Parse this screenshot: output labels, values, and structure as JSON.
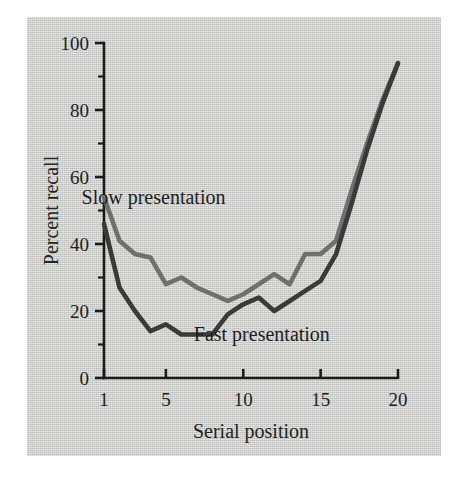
{
  "figure": {
    "background_color": "#ffffff",
    "panel_color": "#cccccb"
  },
  "chart_data": {
    "type": "line",
    "title": "",
    "subtitle": "",
    "xlabel": "Serial position",
    "ylabel": "Percent recall",
    "xlim": [
      1,
      20
    ],
    "ylim": [
      0,
      100
    ],
    "grid": false,
    "legend_position": "inline-annotation",
    "x_ticks_major": [
      1,
      5,
      10,
      15,
      20
    ],
    "x_tick_labels": [
      "1",
      "5",
      "10",
      "15",
      "20"
    ],
    "y_ticks_major": [
      0,
      20,
      40,
      60,
      80,
      100
    ],
    "y_tick_labels": [
      "0",
      "20",
      "40",
      "60",
      "80",
      "100"
    ],
    "y_ticks_minor": [
      10,
      30,
      50,
      70,
      90
    ],
    "x": [
      1,
      2,
      3,
      4,
      5,
      6,
      7,
      8,
      9,
      10,
      11,
      12,
      13,
      14,
      15,
      16,
      17,
      18,
      19,
      20
    ],
    "series": [
      {
        "name": "Slow presentation",
        "color": "#6f6f6f",
        "stroke_width": 4.6,
        "label_x": 4.2,
        "label_y": 52,
        "values": [
          54,
          41,
          37,
          36,
          28,
          30,
          27,
          25,
          23,
          25,
          28,
          31,
          28,
          37,
          37,
          41,
          56,
          70,
          83,
          94
        ]
      },
      {
        "name": "Fast presentation",
        "color": "#3a3a3a",
        "stroke_width": 4.6,
        "label_x": 11.2,
        "label_y": 11,
        "values": [
          46,
          27,
          20,
          14,
          16,
          13,
          13,
          13,
          19,
          22,
          24,
          20,
          23,
          26,
          29,
          37,
          52,
          68,
          82,
          94
        ]
      }
    ],
    "annotations": [
      {
        "text": "Slow presentation",
        "x": 4.2,
        "y": 52
      },
      {
        "text": "Fast presentation",
        "x": 11.2,
        "y": 11
      }
    ]
  }
}
